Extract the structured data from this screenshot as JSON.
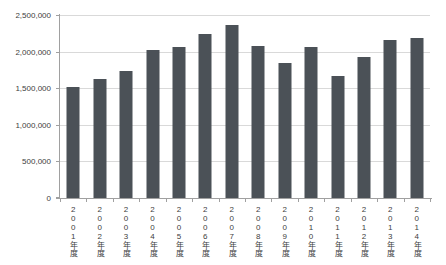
{
  "chart_data": {
    "type": "bar",
    "title": "",
    "xlabel": "",
    "ylabel": "",
    "categories": [
      "2001年度",
      "2002年度",
      "2003年度",
      "2004年度",
      "2005年度",
      "2006年度",
      "2007年度",
      "2008年度",
      "2009年度",
      "2010年度",
      "2011年度",
      "2012年度",
      "2013年度",
      "2014年度"
    ],
    "values": [
      1520000,
      1630000,
      1740000,
      2020000,
      2060000,
      2240000,
      2360000,
      2070000,
      1840000,
      2060000,
      1670000,
      1930000,
      2160000,
      2190000
    ],
    "ylim": [
      0,
      2500000
    ],
    "ytick_interval": 500000,
    "yticks": [
      0,
      500000,
      1000000,
      1500000,
      2000000,
      2500000
    ],
    "ytick_labels": [
      "0",
      "500,000",
      "1,000,000",
      "1,500,000",
      "2,000,000",
      "2,500,000"
    ],
    "grid": true,
    "legend": false,
    "bar_width_px": 13,
    "colors": {
      "bar": "#4b5157",
      "gridline": "#d9d9d9",
      "axis": "#a0a0a0",
      "tick_label": "#404040",
      "background": "#ffffff"
    }
  }
}
